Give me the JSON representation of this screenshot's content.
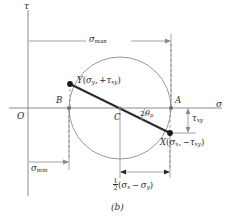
{
  "figure": {
    "caption": "(b)",
    "type": "mohrs-circle-stress-diagram"
  },
  "axes": {
    "vertical_label": "τ",
    "horizontal_label": "σ",
    "origin_label": "O"
  },
  "points": {
    "center": {
      "label": "C"
    },
    "left_intersection": {
      "label": "B"
    },
    "right_intersection": {
      "label": "A"
    },
    "point_y": {
      "name": "Y",
      "sigma": "σ",
      "sigma_sub": "y",
      "tau_sign": "+",
      "tau": "τ",
      "tau_sub": "xy"
    },
    "point_x": {
      "name": "X",
      "sigma": "σ",
      "sigma_sub": "x",
      "tau_sign": "−",
      "tau": "τ",
      "tau_sub": "xy"
    }
  },
  "dimensions": {
    "sigma_max": {
      "symbol": "σ",
      "subscript": "max"
    },
    "sigma_min": {
      "symbol": "σ",
      "subscript": "min"
    },
    "tau_xy": {
      "symbol": "τ",
      "subscript": "xy"
    },
    "half_difference": {
      "numerator": "1",
      "denominator": "2",
      "expr_open": "(",
      "sigma_1": "σ",
      "sigma_1_sub": "x",
      "minus": "−",
      "sigma_2": "σ",
      "sigma_2_sub": "y",
      "expr_close": ")"
    },
    "angle": {
      "value": "2",
      "symbol": "θ",
      "subscript": "p"
    }
  },
  "colors": {
    "axis": "#8a8a8a",
    "circle": "#9a9a9a",
    "diameter": "#2b2b2b",
    "dimension": "#8a8a8a",
    "dashed": "#8a8a8a",
    "text": "#2b2b2b",
    "background": "#ffffff"
  }
}
